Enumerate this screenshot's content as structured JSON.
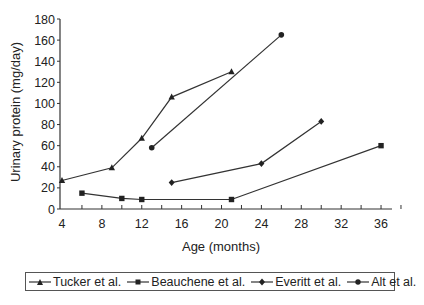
{
  "chart_data": {
    "type": "line",
    "title": "",
    "xlabel": "Age (months)",
    "ylabel": "Urinary protein (mg/day)",
    "xlim": [
      4,
      38
    ],
    "ylim": [
      0,
      180
    ],
    "x_ticks": [
      4,
      8,
      12,
      16,
      20,
      24,
      28,
      32,
      36
    ],
    "y_ticks": [
      0,
      20,
      40,
      60,
      80,
      100,
      120,
      140,
      160,
      180
    ],
    "grid": false,
    "legend_position": "bottom",
    "series": [
      {
        "name": "Tucker et al.",
        "marker": "triangle",
        "points": [
          [
            4,
            27
          ],
          [
            9,
            39
          ],
          [
            12,
            67
          ],
          [
            15,
            106
          ],
          [
            21,
            130
          ]
        ]
      },
      {
        "name": "Beauchene et al.",
        "marker": "square",
        "points": [
          [
            6,
            15
          ],
          [
            10,
            10
          ],
          [
            12,
            9
          ],
          [
            21,
            9
          ],
          [
            36,
            60
          ]
        ]
      },
      {
        "name": "Everitt et al.",
        "marker": "diamond",
        "points": [
          [
            15,
            25
          ],
          [
            24,
            43
          ],
          [
            30,
            83
          ]
        ]
      },
      {
        "name": "Alt et al.",
        "marker": "circle",
        "points": [
          [
            13,
            58
          ],
          [
            26,
            165
          ]
        ]
      }
    ]
  },
  "legend": {
    "items": [
      {
        "label": "Tucker et al."
      },
      {
        "label": "Beauchene et al."
      },
      {
        "label": "Everitt et al."
      },
      {
        "label": "Alt et al."
      }
    ]
  }
}
